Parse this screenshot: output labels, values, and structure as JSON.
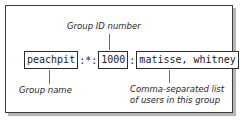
{
  "figure": {
    "kind": "annotated-syntax-diagram",
    "colors": {
      "frame_border": "#3c3c3c",
      "frame_shadow": "#b6b6b6",
      "token_border": "#2d2d2d",
      "text": "#1a1a1a",
      "label_text": "#262626",
      "leader_line": "#6d6d6d",
      "background": "#ffffff"
    }
  },
  "syntax_line": {
    "full_text": "peachpit:*:1000:matisse, whitney",
    "tokens": [
      {
        "id": "group-name",
        "text": "peachpit",
        "boxed": true
      },
      {
        "id": "separator-1",
        "text": ":*:",
        "boxed": false
      },
      {
        "id": "group-id",
        "text": "1000",
        "boxed": true
      },
      {
        "id": "separator-2",
        "text": ":",
        "boxed": false
      },
      {
        "id": "member-list",
        "text": "matisse, whitney",
        "boxed": true
      }
    ]
  },
  "callouts": {
    "group_id": {
      "text": "Group ID number",
      "points_to": "group-id"
    },
    "group_name": {
      "text": "Group name",
      "points_to": "group-name"
    },
    "members": {
      "line1": "Comma-separated list",
      "line2": "of users in this group",
      "points_to": "member-list"
    }
  }
}
